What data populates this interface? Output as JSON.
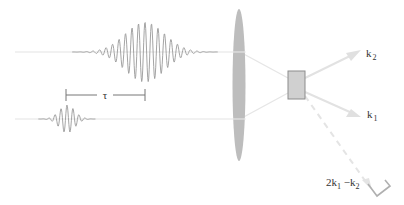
{
  "diagram": {
    "labels": {
      "delay": "τ",
      "k2_base": "k",
      "k2_sub": "2",
      "k1_base": "k",
      "k1_sub": "1",
      "signal_coef": "2k",
      "signal_sub1": "1",
      "signal_minus": " −k",
      "signal_sub2": "2"
    },
    "colors": {
      "beam": "#e4e4e4",
      "pulse": "#9a9a9a",
      "lens": "#bdbdbd",
      "crystal_fill": "#d0d0d0",
      "crystal_stroke": "#8c8c8c",
      "arrow": "#e0e0e0",
      "bracket": "#777777",
      "detector": "#b0b0b0"
    },
    "pulses": [
      {
        "name": "pulse-k2",
        "baseline_y": 52,
        "center_x": 145,
        "amplitude": 30,
        "sigma": 28,
        "period": 6.5,
        "start_x": 15,
        "end_x": 233
      },
      {
        "name": "pulse-k1",
        "baseline_y": 119,
        "center_x": 67,
        "amplitude": 14,
        "sigma": 11,
        "period": 6.0,
        "start_x": 15,
        "end_x": 233
      }
    ]
  }
}
